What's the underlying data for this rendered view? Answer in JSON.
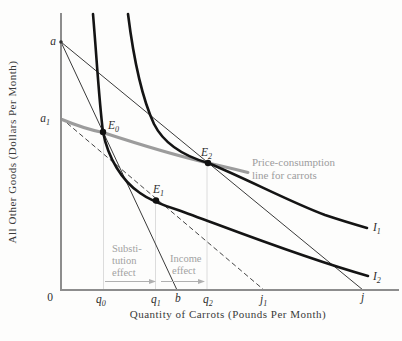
{
  "figure": {
    "axis_titles": {
      "y": "All Other Goods (Dollars Per Month)",
      "x": "Quantity of Carrots (Pounds Per Month)"
    },
    "origin": "0",
    "y_axis_labels": {
      "a": {
        "base": "a",
        "sub": ""
      },
      "a1": {
        "base": "a",
        "sub": "1"
      }
    },
    "x_axis_labels": {
      "q0": {
        "base": "q",
        "sub": "0"
      },
      "q1": {
        "base": "q",
        "sub": "1"
      },
      "b": {
        "base": "b",
        "sub": ""
      },
      "q2": {
        "base": "q",
        "sub": "2"
      },
      "j1": {
        "base": "j",
        "sub": "1"
      },
      "j": {
        "base": "j",
        "sub": ""
      }
    },
    "equilibrium_points": {
      "E0": {
        "base": "E",
        "sub": "0"
      },
      "E1": {
        "base": "E",
        "sub": "1"
      },
      "E2": {
        "base": "E",
        "sub": "2"
      }
    },
    "curve_labels": {
      "I1": {
        "base": "I",
        "sub": "1"
      },
      "I2": {
        "base": "I",
        "sub": "2"
      }
    },
    "annotations": {
      "substitution_effect": {
        "lines": [
          "Substi-",
          "tution",
          "effect"
        ]
      },
      "income_effect": {
        "lines": [
          "Income",
          "effect"
        ]
      },
      "price_consumption": {
        "lines": [
          "Price-consumption",
          "line for carrots"
        ]
      }
    },
    "colors": {
      "indifference_curve": "#141414",
      "budget_line": "#3a3a3a",
      "price_consumption_line": "#9c9c9c",
      "annotation_text": "#a2a2a2",
      "axis": "#8d8d8d",
      "guide_line": "#dcdcdc",
      "label_text": "#2e2e2e"
    }
  }
}
